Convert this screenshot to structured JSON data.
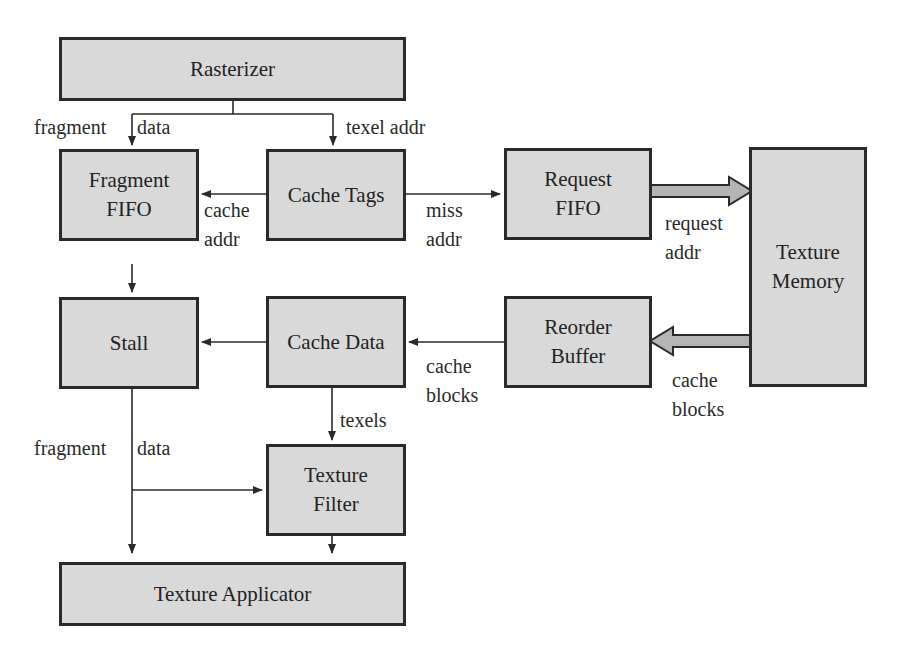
{
  "diagram": {
    "type": "block-diagram",
    "colors": {
      "box_fill": "#d9d9d9",
      "box_border": "#2a2a2a",
      "wide_arrow_fill": "#b4b4b4",
      "line": "#2a2a2a"
    },
    "blocks": {
      "rasterizer": "Rasterizer",
      "fragment_fifo": "Fragment\nFIFO",
      "cache_tags": "Cache Tags",
      "request_fifo": "Request\nFIFO",
      "texture_memory": "Texture\nMemory",
      "stall": "Stall",
      "cache_data": "Cache Data",
      "reorder_buffer": "Reorder\nBuffer",
      "texture_filter": "Texture\nFilter",
      "texture_applicator": "Texture Applicator"
    },
    "edge_labels": {
      "fragment_data_top": "fragment",
      "fragment_data_top_2": "data",
      "texel_addr": "texel addr",
      "cache_addr": "cache\naddr",
      "miss_addr": "miss\naddr",
      "request_addr": "request\naddr",
      "cache_blocks_mem": "cache\nblocks",
      "cache_blocks_reorder": "cache\nblocks",
      "texels": "texels",
      "fragment_data_bottom": "fragment",
      "fragment_data_bottom_2": "data"
    },
    "edges": [
      {
        "from": "Rasterizer",
        "to": "Fragment FIFO",
        "label": "fragment data"
      },
      {
        "from": "Rasterizer",
        "to": "Cache Tags",
        "label": "texel addr"
      },
      {
        "from": "Cache Tags",
        "to": "Fragment FIFO",
        "label": "cache addr"
      },
      {
        "from": "Cache Tags",
        "to": "Request FIFO",
        "label": "miss addr"
      },
      {
        "from": "Request FIFO",
        "to": "Texture Memory",
        "label": "request addr",
        "style": "wide"
      },
      {
        "from": "Texture Memory",
        "to": "Reorder Buffer",
        "label": "cache blocks",
        "style": "wide"
      },
      {
        "from": "Reorder Buffer",
        "to": "Cache Data",
        "label": "cache blocks"
      },
      {
        "from": "Fragment FIFO",
        "to": "Stall",
        "label": ""
      },
      {
        "from": "Cache Data",
        "to": "Stall",
        "label": ""
      },
      {
        "from": "Cache Data",
        "to": "Texture Filter",
        "label": "texels"
      },
      {
        "from": "Stall",
        "to": "Texture Filter",
        "label": "fragment data"
      },
      {
        "from": "Stall",
        "to": "Texture Applicator",
        "label": "fragment data"
      },
      {
        "from": "Texture Filter",
        "to": "Texture Applicator",
        "label": ""
      }
    ]
  }
}
